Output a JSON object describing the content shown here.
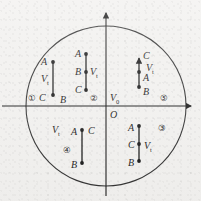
{
  "figure": {
    "colors": {
      "ink": "#1a1a1a",
      "background": "#f3f2f0",
      "circle_stroke": "#333333"
    },
    "axes": {
      "x_axis_label": "",
      "y_axis_label": "",
      "origin_label": "O",
      "origin_voltage_label": "V",
      "origin_voltage_sub": "0"
    },
    "circle": {
      "center_x": 106,
      "center_y": 106,
      "radius": 80
    },
    "regions": [
      {
        "id": "region-1",
        "number": "①",
        "vt_label": "V",
        "vt_sub": "t",
        "points": [
          "A",
          "B",
          "C"
        ],
        "top_point": "A",
        "bottom_point": "C",
        "side_point": "B",
        "arrow_direction": "none"
      },
      {
        "id": "region-2",
        "number": "②",
        "vt_label": "V",
        "vt_sub": "t",
        "points": [
          "A",
          "B",
          "C"
        ],
        "top_point": "A",
        "middle_point": "B",
        "bottom_point": "C",
        "arrow_direction": "none"
      },
      {
        "id": "region-3",
        "number": "③",
        "vt_label": "V",
        "vt_sub": "t",
        "points": [
          "A",
          "C",
          "B"
        ],
        "top_point": "A",
        "middle_point": "C",
        "bottom_point": "B",
        "arrow_direction": "none"
      },
      {
        "id": "region-4",
        "number": "④",
        "vt_label": "V",
        "vt_sub": "t",
        "points": [
          "A",
          "C",
          "B"
        ],
        "top_point": "A",
        "side_point": "C",
        "bottom_point": "B",
        "arrow_direction": "none"
      },
      {
        "id": "region-5",
        "number": "⑤",
        "vt_label": "V",
        "vt_sub": "t",
        "points": [
          "C",
          "A",
          "B"
        ],
        "top_point": "C",
        "middle_point": "A",
        "bottom_point": "B",
        "arrow_direction": "up"
      }
    ]
  }
}
